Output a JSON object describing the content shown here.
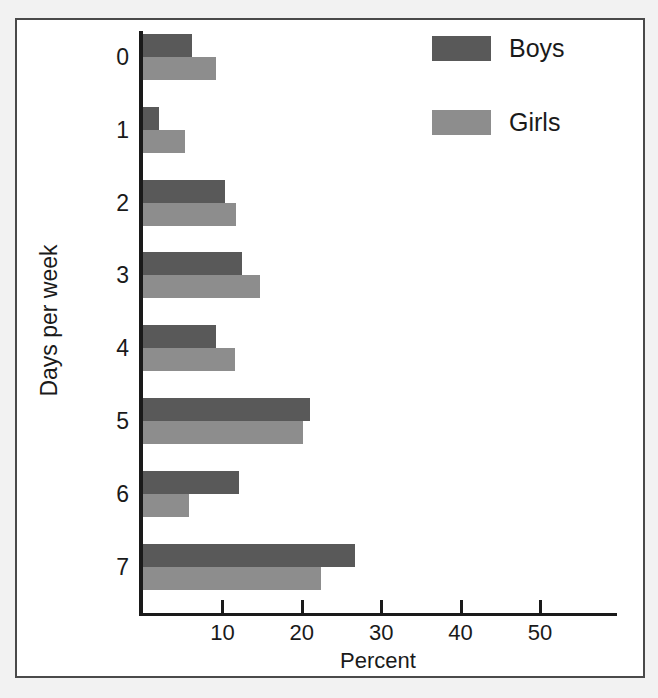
{
  "figure": {
    "title": "(title cropped at top edge)",
    "frame_border_color": "#4a4a4a"
  },
  "legend": {
    "position": "top-right",
    "entries": [
      {
        "label": "Boys",
        "color": "#595959"
      },
      {
        "label": "Girls",
        "color": "#8d8d8d"
      }
    ]
  },
  "axes": {
    "x_title": "Percent",
    "y_title": "Days per week",
    "x_ticks": [
      "10",
      "20",
      "30",
      "40",
      "50"
    ],
    "y_ticks": [
      "0",
      "1",
      "2",
      "3",
      "4",
      "5",
      "6",
      "7"
    ]
  },
  "chart_data": {
    "type": "bar",
    "orientation": "horizontal",
    "title": "",
    "xlabel": "Percent",
    "ylabel": "Days per week",
    "categories": [
      "0",
      "1",
      "2",
      "3",
      "4",
      "5",
      "6",
      "7"
    ],
    "xlim": [
      0,
      58
    ],
    "ylim": null,
    "grid": false,
    "legend_position": "top-right",
    "series": [
      {
        "name": "Boys",
        "color": "#595959",
        "values": [
          6.3,
          2.1,
          10.5,
          12.6,
          9.3,
          21.2,
          12.2,
          26.8
        ]
      },
      {
        "name": "Girls",
        "color": "#8d8d8d",
        "values": [
          9.3,
          5.4,
          11.8,
          14.9,
          11.7,
          20.3,
          5.9,
          22.5
        ]
      }
    ]
  }
}
